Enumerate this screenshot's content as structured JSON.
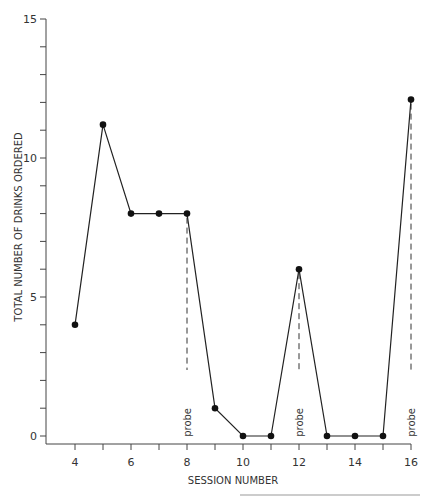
{
  "chart_data": {
    "type": "line",
    "title": "",
    "xlabel": "SESSION NUMBER",
    "ylabel": "TOTAL NUMBER OF DRINKS ORDERED",
    "x": [
      4,
      5,
      6,
      7,
      8,
      9,
      10,
      11,
      12,
      13,
      14,
      15,
      16
    ],
    "series": [
      {
        "name": "Drinks ordered",
        "values": [
          4,
          11.2,
          8,
          8,
          8,
          1,
          0,
          0,
          6,
          0,
          0,
          0,
          12.1
        ]
      }
    ],
    "xlim": [
      3,
      16
    ],
    "ylim": [
      0,
      15
    ],
    "x_ticks": [
      4,
      5,
      6,
      7,
      8,
      9,
      10,
      11,
      12,
      13,
      14,
      15,
      16
    ],
    "x_tick_labels": [
      "4",
      "6",
      "8",
      "10",
      "12",
      "14",
      "16"
    ],
    "y_ticks": [
      0,
      1,
      2,
      3,
      4,
      5,
      6,
      7,
      8,
      9,
      10,
      11,
      12,
      13,
      14,
      15
    ],
    "y_tick_labels": [
      "0",
      "5",
      "10",
      "15"
    ],
    "annotations": [
      {
        "x": 8,
        "text": "probe",
        "style": "dashed vertical line"
      },
      {
        "x": 12,
        "text": "probe",
        "style": "dashed vertical line"
      },
      {
        "x": 16,
        "text": "probe",
        "style": "dashed vertical line"
      }
    ],
    "grid": false,
    "legend": "none"
  },
  "colors": {
    "line": "#222222",
    "marker": "#111111",
    "axis": "#444444"
  }
}
